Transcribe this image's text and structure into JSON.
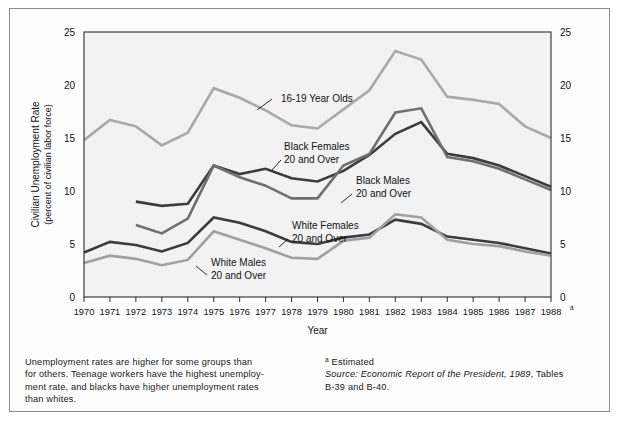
{
  "figure": {
    "note_left": [
      "Unemployment rates are higher for some groups than",
      "for others. Teenage workers have the highest unemploy-",
      "ment rate, and blacks have higher unemployment rates",
      "than whites."
    ],
    "footnote_marker": "a",
    "footnote_text": "Estimated",
    "source_label": "Source: Economic Report of the President, 1989",
    "source_tail": ", Tables",
    "source_line2": "B-39 and B-40."
  },
  "chart_data": {
    "type": "line",
    "title": "",
    "xlabel": "Year",
    "ylabel_line1": "Civilian Unemployment Rate",
    "ylabel_line2": "(percent of civilian labor force)",
    "grid": false,
    "legend_position": "inline-annotations",
    "xlim": [
      1970,
      1988
    ],
    "ylim": [
      0,
      25
    ],
    "yticks": [
      0,
      5,
      10,
      15,
      20,
      25
    ],
    "ytick_labels": [
      "0",
      "5",
      "10",
      "15",
      "20",
      "25"
    ],
    "x": [
      1970,
      1971,
      1972,
      1973,
      1974,
      1975,
      1976,
      1977,
      1978,
      1979,
      1980,
      1981,
      1982,
      1983,
      1984,
      1985,
      1986,
      1987,
      1988
    ],
    "xtick_labels": [
      "1970",
      "1971",
      "1972",
      "1973",
      "1974",
      "1975",
      "1976",
      "1977",
      "1978",
      "1979",
      "1980",
      "1981",
      "1982",
      "1983",
      "1984",
      "1985",
      "1986",
      "1987",
      "1988"
    ],
    "xtick_last_superscript": "a",
    "series": [
      {
        "name": "16-19 Year Olds",
        "label_line1": "16-19 Year Olds",
        "label_line2": "",
        "color": "#a9a9a9",
        "width": 2.6,
        "x": [
          1970,
          1971,
          1972,
          1973,
          1974,
          1975,
          1976,
          1977,
          1978,
          1979,
          1980,
          1981,
          1982,
          1983,
          1984,
          1985,
          1986,
          1987,
          1988
        ],
        "values": [
          14.8,
          16.7,
          16.1,
          14.3,
          15.5,
          19.7,
          18.8,
          17.6,
          16.2,
          15.9,
          17.7,
          19.5,
          23.2,
          22.4,
          18.9,
          18.6,
          18.2,
          16.1,
          15.0
        ]
      },
      {
        "name": "Black Females 20 and Over",
        "label_line1": "Black Females",
        "label_line2": "20 and Over",
        "color": "#3c3c3c",
        "width": 2.6,
        "x": [
          1972,
          1973,
          1974,
          1975,
          1976,
          1977,
          1978,
          1979,
          1980,
          1981,
          1982,
          1983,
          1984,
          1985,
          1986,
          1987,
          1988
        ],
        "values": [
          9.0,
          8.6,
          8.8,
          12.4,
          11.6,
          12.1,
          11.2,
          10.9,
          11.9,
          13.4,
          15.4,
          16.5,
          13.5,
          13.1,
          12.4,
          11.4,
          10.4
        ]
      },
      {
        "name": "Black Males 20 and Over",
        "label_line1": "Black Males",
        "label_line2": "20 and Over",
        "color": "#707070",
        "width": 2.6,
        "x": [
          1972,
          1973,
          1974,
          1975,
          1976,
          1977,
          1978,
          1979,
          1980,
          1981,
          1982,
          1983,
          1984,
          1985,
          1986,
          1987,
          1988
        ],
        "values": [
          6.8,
          6.0,
          7.4,
          12.4,
          11.3,
          10.5,
          9.3,
          9.3,
          12.4,
          13.5,
          17.4,
          17.8,
          13.2,
          12.8,
          12.1,
          11.1,
          10.1
        ]
      },
      {
        "name": "White Females 20 and Over",
        "label_line1": "White Females",
        "label_line2": "20 and Over",
        "color": "#3c3c3c",
        "width": 2.6,
        "x": [
          1970,
          1971,
          1972,
          1973,
          1974,
          1975,
          1976,
          1977,
          1978,
          1979,
          1980,
          1981,
          1982,
          1983,
          1984,
          1985,
          1986,
          1987,
          1988
        ],
        "values": [
          4.2,
          5.2,
          4.9,
          4.3,
          5.1,
          7.5,
          7.0,
          6.2,
          5.2,
          5.0,
          5.6,
          5.9,
          7.3,
          6.9,
          5.7,
          5.4,
          5.1,
          4.6,
          4.1
        ]
      },
      {
        "name": "White Males 20 and Over",
        "label_line1": "White Males",
        "label_line2": "20 and Over",
        "color": "#a0a0a0",
        "width": 2.6,
        "x": [
          1970,
          1971,
          1972,
          1973,
          1974,
          1975,
          1976,
          1977,
          1978,
          1979,
          1980,
          1981,
          1982,
          1983,
          1984,
          1985,
          1986,
          1987,
          1988
        ],
        "values": [
          3.2,
          3.9,
          3.6,
          3.0,
          3.5,
          6.2,
          5.4,
          4.6,
          3.7,
          3.6,
          5.3,
          5.6,
          7.8,
          7.5,
          5.4,
          5.0,
          4.8,
          4.3,
          3.9
        ]
      }
    ],
    "annotations": [
      {
        "name": "16-19 Year Olds",
        "text_line1": "16-19 Year Olds",
        "text_line2": "",
        "text_x": 281,
        "text_y": 102,
        "leader": [
          272,
          99,
          257,
          110
        ]
      },
      {
        "name": "Black Females 20 and Over",
        "text_line1": "Black Females",
        "text_line2": "20 and Over",
        "text_x": 284,
        "text_y": 150,
        "leader": [
          281,
          160,
          272,
          170
        ]
      },
      {
        "name": "Black Males 20 and Over",
        "text_line1": "Black Males",
        "text_line2": "20 and Over",
        "text_x": 356,
        "text_y": 184,
        "leader": [
          352,
          194,
          341,
          203
        ]
      },
      {
        "name": "White Females 20 and Over",
        "text_line1": "White Females",
        "text_line2": "20 and Over",
        "text_x": 292,
        "text_y": 229,
        "leader": [
          288,
          239,
          279,
          247
        ]
      },
      {
        "name": "White Males 20 and Over",
        "text_line1": "White Males",
        "text_line2": "20 and Over",
        "text_x": 211,
        "text_y": 266,
        "leader": [
          207,
          275,
          196,
          266
        ]
      }
    ]
  }
}
